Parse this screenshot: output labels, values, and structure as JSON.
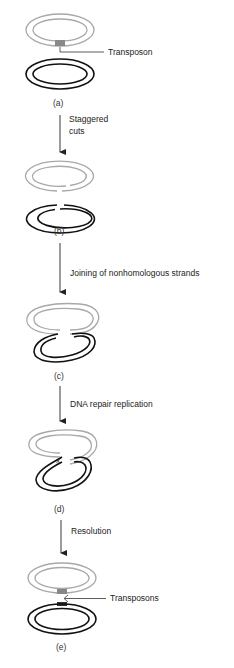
{
  "diagram": {
    "colors": {
      "donor": "#a8a8a8",
      "target": "#111111",
      "text": "#222222"
    },
    "stages": [
      {
        "id": "a",
        "label": "(a)",
        "annotation": "Transposon"
      },
      {
        "id": "b",
        "label": "(b)"
      },
      {
        "id": "c",
        "label": "(c)"
      },
      {
        "id": "d",
        "label": "(d)",
        "mark": "X"
      },
      {
        "id": "e",
        "label": "(e)",
        "annotation": "Transposons"
      }
    ],
    "steps": [
      {
        "from": "a",
        "to": "b",
        "line1": "Staggered",
        "line2": "cuts"
      },
      {
        "from": "b",
        "to": "c",
        "line1": "Joining of nonhomologous strands"
      },
      {
        "from": "c",
        "to": "d",
        "line1": "DNA repair replication"
      },
      {
        "from": "d",
        "to": "e",
        "line1": "Resolution"
      }
    ]
  }
}
